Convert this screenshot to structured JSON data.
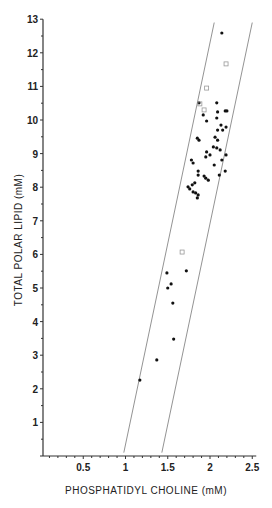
{
  "chart_data": {
    "type": "scatter",
    "title": "",
    "xlabel": "PHOSPHATIDYL CHOLINE (mM)",
    "ylabel": "TOTAL POLAR LIPID (mM)",
    "xlim": [
      0,
      2.5
    ],
    "ylim": [
      0,
      13
    ],
    "x_ticks": [
      {
        "value": 0.5,
        "label": "0.5"
      },
      {
        "value": 1,
        "label": "1"
      },
      {
        "value": 1.5,
        "label": "1.5"
      },
      {
        "value": 2,
        "label": "2"
      },
      {
        "value": 2.5,
        "label": "2.5"
      }
    ],
    "y_ticks": [
      {
        "value": 1,
        "label": "1"
      },
      {
        "value": 2,
        "label": "2"
      },
      {
        "value": 3,
        "label": "3"
      },
      {
        "value": 4,
        "label": "4"
      },
      {
        "value": 5,
        "label": "5"
      },
      {
        "value": 6,
        "label": "6"
      },
      {
        "value": 7,
        "label": "7"
      },
      {
        "value": 8,
        "label": "8"
      },
      {
        "value": 9,
        "label": "9"
      },
      {
        "value": 10,
        "label": "10"
      },
      {
        "value": 11,
        "label": "11"
      },
      {
        "value": 12,
        "label": "12"
      },
      {
        "value": 13,
        "label": "13"
      }
    ],
    "grid": false,
    "legend": "none",
    "series": [
      {
        "name": "filled circles",
        "marker": "filled-circle",
        "points": [
          [
            2.14,
            12.59
          ],
          [
            1.87,
            10.51
          ],
          [
            2.08,
            10.51
          ],
          [
            2.09,
            10.24
          ],
          [
            2.18,
            10.27
          ],
          [
            2.2,
            10.27
          ],
          [
            1.92,
            10.15
          ],
          [
            1.96,
            9.97
          ],
          [
            2.08,
            10.06
          ],
          [
            2.13,
            9.85
          ],
          [
            2.09,
            9.7
          ],
          [
            2.19,
            9.79
          ],
          [
            2.15,
            9.7
          ],
          [
            1.85,
            9.46
          ],
          [
            1.87,
            9.4
          ],
          [
            2.06,
            9.49
          ],
          [
            2.09,
            9.4
          ],
          [
            2.04,
            9.2
          ],
          [
            2.08,
            9.17
          ],
          [
            2.12,
            9.11
          ],
          [
            2.19,
            8.96
          ],
          [
            1.96,
            9.05
          ],
          [
            2.0,
            8.96
          ],
          [
            1.78,
            8.81
          ],
          [
            1.8,
            8.72
          ],
          [
            1.95,
            8.9
          ],
          [
            2.05,
            8.66
          ],
          [
            2.14,
            8.81
          ],
          [
            2.18,
            8.48
          ],
          [
            2.11,
            8.36
          ],
          [
            1.86,
            8.48
          ],
          [
            1.86,
            8.36
          ],
          [
            1.93,
            8.33
          ],
          [
            1.95,
            8.27
          ],
          [
            1.98,
            8.21
          ],
          [
            1.82,
            8.13
          ],
          [
            1.79,
            8.07
          ],
          [
            1.74,
            8.01
          ],
          [
            1.76,
            7.95
          ],
          [
            1.8,
            7.86
          ],
          [
            1.83,
            7.83
          ],
          [
            1.86,
            7.77
          ],
          [
            1.85,
            7.68
          ],
          [
            1.49,
            5.45
          ],
          [
            1.72,
            5.51
          ],
          [
            1.54,
            5.12
          ],
          [
            1.5,
            5.0
          ],
          [
            1.56,
            4.55
          ],
          [
            1.57,
            3.48
          ],
          [
            1.37,
            2.86
          ],
          [
            1.17,
            2.26
          ]
        ]
      },
      {
        "name": "open squares",
        "marker": "open-square",
        "points": [
          [
            2.19,
            11.67
          ],
          [
            1.96,
            10.95
          ],
          [
            1.88,
            10.48
          ],
          [
            1.93,
            10.3
          ],
          [
            1.67,
            6.07
          ]
        ]
      }
    ],
    "reference_lines": [
      {
        "name": "lower bound line",
        "from": [
          0.98,
          0.1
        ],
        "to": [
          2.05,
          12.9
        ]
      },
      {
        "name": "upper bound line",
        "from": [
          1.43,
          0.1
        ],
        "to": [
          2.5,
          12.9
        ]
      }
    ]
  }
}
